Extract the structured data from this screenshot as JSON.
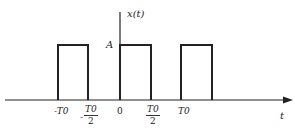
{
  "diagram": {
    "title": "",
    "y_axis_label": "x(t)",
    "x_axis_label": "t",
    "amplitude_label": "A",
    "ticks": {
      "neg_T0": "-T0",
      "neg_half_T0": {
        "sign": "-",
        "num": "T0",
        "den": "2"
      },
      "zero": "0",
      "half_T0": {
        "num": "T0",
        "den": "2"
      },
      "T0": "T0"
    },
    "pulses": [
      {
        "start": "-T0",
        "end": "-T0/2",
        "height": "A"
      },
      {
        "start": "0",
        "end": "T0/2",
        "height": "A"
      },
      {
        "start": "T0",
        "end": "3T0/2",
        "height": "A"
      }
    ],
    "colors": {
      "line": "#222222",
      "background": "#ffffff"
    }
  }
}
